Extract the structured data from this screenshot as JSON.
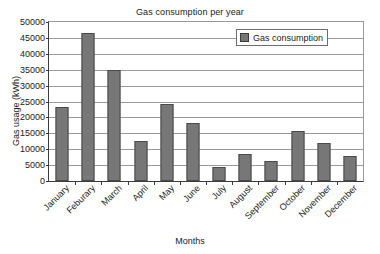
{
  "chart_data": {
    "type": "bar",
    "title": "Gas consumption per year",
    "xlabel": "Months",
    "ylabel": "Gas usage (kWh)",
    "categories": [
      "January",
      "Feburary",
      "March",
      "April",
      "May",
      "June",
      "July",
      "August",
      "September",
      "October",
      "November",
      "December"
    ],
    "values": [
      23300,
      46400,
      35000,
      12600,
      24300,
      18400,
      4500,
      8500,
      6300,
      15800,
      12000,
      8000
    ],
    "series": [
      {
        "name": "Gas consumption",
        "values": [
          23300,
          46400,
          35000,
          12600,
          24300,
          18400,
          4500,
          8500,
          6300,
          15800,
          12000,
          8000
        ]
      }
    ],
    "ylim": [
      0,
      50000
    ],
    "ytick_step": 5000,
    "yticks": [
      0,
      5000,
      10000,
      15000,
      20000,
      25000,
      30000,
      35000,
      40000,
      45000,
      50000
    ],
    "ytick_labels": [
      "0",
      "5000",
      "10000",
      "15000",
      "20000",
      "25000",
      "30000",
      "35000",
      "40000",
      "45000",
      "50000"
    ],
    "grid": true,
    "grid_axis": "y",
    "legend": {
      "position": "top-right",
      "entries": [
        "Gas consumption"
      ]
    },
    "bar_color": "#777777",
    "bar_edge_color": "#4a4a4a",
    "gridline_color": "#9a9a9a",
    "axis_color": "#3c3c3c",
    "background_color": "#ffffff",
    "xtick_label_rotation": -45
  }
}
